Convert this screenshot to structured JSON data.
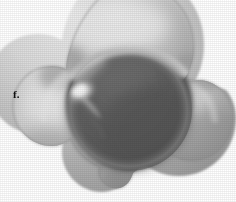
{
  "panel": {
    "label": "f.",
    "figure_kind": "3d-rendered-surface",
    "description": "Grayscale shaded three-lobed (trefoil) concave surface render on white background"
  },
  "colors": {
    "background": "#ffffff",
    "label_color": "#0d0d0d",
    "rim_light": "#d9d9d9",
    "rim_mid": "#c2c2c2",
    "rim_shadow": "#9a9a9a",
    "cavity_dark": "#5b5b5b",
    "cavity_darkest": "#4f4f4f",
    "specular_highlight": "#f2f2f2",
    "outline_shadow": "#7a7a7a"
  },
  "geometry": {
    "lobe_count": 3,
    "lobe_centers": [
      {
        "name": "top-lobe",
        "cx": 130,
        "cy": 48,
        "r": 62
      },
      {
        "name": "left-lobe",
        "cx": 72,
        "cy": 128,
        "r": 55
      },
      {
        "name": "right-lobe",
        "cx": 186,
        "cy": 124,
        "r": 50
      }
    ],
    "cavity": {
      "cx": 129,
      "cy": 110,
      "rx": 62,
      "ry": 60
    },
    "specular": {
      "cx": 82,
      "cy": 93,
      "rx": 13,
      "ry": 9,
      "angle_deg": -30
    },
    "bounds": {
      "x_min": 30,
      "x_max": 231,
      "y_min": 0,
      "y_max": 190
    }
  }
}
